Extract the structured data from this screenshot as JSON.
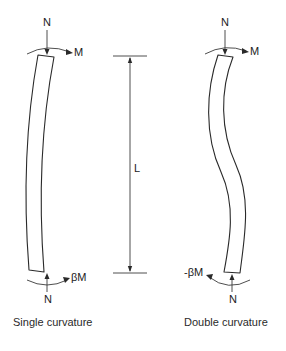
{
  "figure": {
    "left_column": {
      "caption": "Single curvature",
      "top_axial_load": "N",
      "top_moment": "M",
      "bottom_moment": "βM",
      "bottom_axial_load": "N"
    },
    "length_dimension": {
      "label": "L"
    },
    "right_column": {
      "caption": "Double curvature",
      "top_axial_load": "N",
      "top_moment": "M",
      "bottom_moment": "-βM",
      "bottom_axial_load": "N"
    },
    "colors": {
      "line": "#2a2a2a",
      "background": "#ffffff"
    }
  }
}
